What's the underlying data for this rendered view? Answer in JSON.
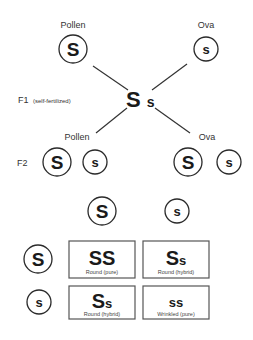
{
  "parents": {
    "pollen": {
      "label": "Pollen",
      "allele": "S"
    },
    "ova": {
      "label": "Ova",
      "allele": "s"
    }
  },
  "f1": {
    "label": "F1",
    "note": "(self-fertilized)",
    "genotype_dominant": "S",
    "genotype_recessive": "s"
  },
  "f2": {
    "label": "F2",
    "pollen": {
      "label": "Pollen",
      "alleles": [
        "S",
        "s"
      ]
    },
    "ova": {
      "label": "Ova",
      "alleles": [
        "S",
        "s"
      ]
    }
  },
  "punnett": {
    "column_headers": [
      "S",
      "s"
    ],
    "row_headers": [
      "S",
      "s"
    ],
    "cells": [
      {
        "a": "S",
        "b": "S",
        "caption": "Round (pure)"
      },
      {
        "a": "S",
        "b": "s",
        "caption": "Round (hybrid)"
      },
      {
        "a": "S",
        "b": "s",
        "caption": "Round (hybrid)"
      },
      {
        "a": "s",
        "b": "s",
        "caption": "Wrinkled (pure)"
      }
    ]
  }
}
